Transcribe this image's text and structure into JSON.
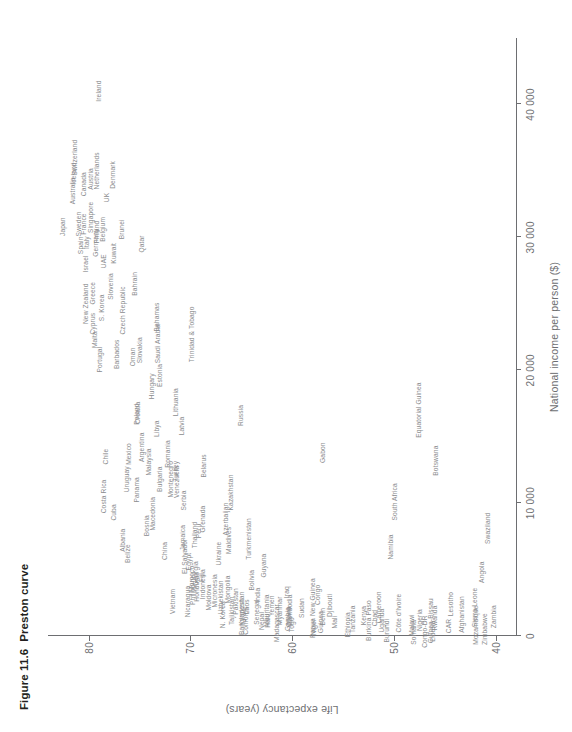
{
  "figure": {
    "number": "Figure 11.6",
    "title": "Preston curve"
  },
  "chart_data": {
    "type": "scatter",
    "title": "Preston curve",
    "xlabel": "National income per person ($)",
    "ylabel": "Life expectancy (years)",
    "xlim": [
      0,
      45000
    ],
    "ylim": [
      38,
      84
    ],
    "xticks": [
      0,
      10000,
      20000,
      30000,
      40000
    ],
    "xtick_labels": [
      "0",
      "10 000",
      "20 000",
      "30 000",
      "40 000"
    ],
    "yticks": [
      40,
      50,
      60,
      70,
      80
    ],
    "ytick_labels": [
      "40",
      "50",
      "60",
      "70",
      "80"
    ],
    "grid": false,
    "legend": null,
    "point_style": "text-label",
    "points": [
      {
        "label": "Zambia",
        "x": 1450,
        "y": 40.2
      },
      {
        "label": "Zimbabwe",
        "x": 520,
        "y": 41.0
      },
      {
        "label": "Mozambique",
        "x": 820,
        "y": 41.9
      },
      {
        "label": "Angola",
        "x": 4800,
        "y": 41.3
      },
      {
        "label": "Sierra Leone",
        "x": 2150,
        "y": 42.0
      },
      {
        "label": "Swaziland",
        "x": 8100,
        "y": 40.8
      },
      {
        "label": "Afghanistan",
        "x": 1620,
        "y": 43.3
      },
      {
        "label": "Lesotho",
        "x": 2400,
        "y": 44.4
      },
      {
        "label": "CAR",
        "x": 750,
        "y": 44.6
      },
      {
        "label": "Liberia",
        "x": 360,
        "y": 46.2
      },
      {
        "label": "Rwanda",
        "x": 1350,
        "y": 46.0
      },
      {
        "label": "Congo-DR",
        "x": 330,
        "y": 46.9
      },
      {
        "label": "Guinea-Bissau",
        "x": 1150,
        "y": 46.4
      },
      {
        "label": "Nigeria",
        "x": 1200,
        "y": 47.4
      },
      {
        "label": "Somalia",
        "x": 280,
        "y": 48.0
      },
      {
        "label": "Malawi",
        "x": 830,
        "y": 48.2
      },
      {
        "label": "Botswana",
        "x": 13200,
        "y": 45.9
      },
      {
        "label": "Equatorial Guinea",
        "x": 17000,
        "y": 47.5
      },
      {
        "label": "South Africa",
        "x": 10100,
        "y": 49.9
      },
      {
        "label": "Namibia",
        "x": 6700,
        "y": 50.3
      },
      {
        "label": "Burundi",
        "x": 400,
        "y": 50.7
      },
      {
        "label": "Côte d'Ivoire",
        "x": 1730,
        "y": 49.5
      },
      {
        "label": "Cameroon",
        "x": 2160,
        "y": 51.5
      },
      {
        "label": "Chad",
        "x": 1350,
        "y": 51.9
      },
      {
        "label": "Uganda",
        "x": 1160,
        "y": 51.2
      },
      {
        "label": "Burkina Faso",
        "x": 1160,
        "y": 52.4
      },
      {
        "label": "Kenya",
        "x": 1540,
        "y": 52.9
      },
      {
        "label": "Tanzania",
        "x": 1260,
        "y": 54.0
      },
      {
        "label": "Ethiopia",
        "x": 850,
        "y": 54.5
      },
      {
        "label": "Mali",
        "x": 1050,
        "y": 55.8
      },
      {
        "label": "Djibouti",
        "x": 2300,
        "y": 56.3
      },
      {
        "label": "Guinea",
        "x": 1050,
        "y": 57.2
      },
      {
        "label": "Niger",
        "x": 680,
        "y": 57.9
      },
      {
        "label": "Gabon",
        "x": 13800,
        "y": 57.0
      },
      {
        "label": "Papua New Guinea",
        "x": 2100,
        "y": 58.0
      },
      {
        "label": "Sudan",
        "x": 2100,
        "y": 59.0
      },
      {
        "label": "Gambia",
        "x": 1280,
        "y": 60.4
      },
      {
        "label": "Togo",
        "x": 850,
        "y": 60.0
      },
      {
        "label": "Ghana",
        "x": 1460,
        "y": 60.3
      },
      {
        "label": "Cambodia",
        "x": 1950,
        "y": 60.2
      },
      {
        "label": "Iraq",
        "x": 3300,
        "y": 60.5
      },
      {
        "label": "Madagascar",
        "x": 980,
        "y": 61.5
      },
      {
        "label": "Haiti",
        "x": 1150,
        "y": 62.4
      },
      {
        "label": "Benin",
        "x": 1450,
        "y": 57.0
      },
      {
        "label": "Congo",
        "x": 3100,
        "y": 57.5
      },
      {
        "label": "Senegal",
        "x": 1790,
        "y": 63.5
      },
      {
        "label": "Comoros",
        "x": 1150,
        "y": 64.5
      },
      {
        "label": "Yemen",
        "x": 2270,
        "y": 62.0
      },
      {
        "label": "Myanmar",
        "x": 1900,
        "y": 61.2
      },
      {
        "label": "Nepal",
        "x": 1130,
        "y": 63.0
      },
      {
        "label": "Laos",
        "x": 2200,
        "y": 64.4
      },
      {
        "label": "Mauritania",
        "x": 1920,
        "y": 62.5
      },
      {
        "label": "Bangladesh",
        "x": 1440,
        "y": 64.9
      },
      {
        "label": "Pakistan",
        "x": 2600,
        "y": 65.5
      },
      {
        "label": "India",
        "x": 3080,
        "y": 63.4
      },
      {
        "label": "Bolivia",
        "x": 4200,
        "y": 63.9
      },
      {
        "label": "Guyana",
        "x": 5300,
        "y": 62.8
      },
      {
        "label": "Kyrgyzstan",
        "x": 2050,
        "y": 64.9
      },
      {
        "label": "Mongolia",
        "x": 3500,
        "y": 66.3
      },
      {
        "label": "N. Korea",
        "x": 1600,
        "y": 66.8
      },
      {
        "label": "Tajikistan",
        "x": 1900,
        "y": 65.9
      },
      {
        "label": "Turkmenistan",
        "x": 7300,
        "y": 64.2
      },
      {
        "label": "Azerbaijan",
        "x": 8800,
        "y": 66.5
      },
      {
        "label": "Uzbekistan",
        "x": 2900,
        "y": 67.0
      },
      {
        "label": "Moldova",
        "x": 2900,
        "y": 68.2
      },
      {
        "label": "Indonesia",
        "x": 3900,
        "y": 68.8
      },
      {
        "label": "Fiji",
        "x": 4400,
        "y": 68.9
      },
      {
        "label": "Belarus",
        "x": 12800,
        "y": 68.7
      },
      {
        "label": "Georgia",
        "x": 4700,
        "y": 69.5
      },
      {
        "label": "Morocco",
        "x": 4300,
        "y": 69.8
      },
      {
        "label": "Nicaragua",
        "x": 2600,
        "y": 70.2
      },
      {
        "label": "Egypt",
        "x": 5600,
        "y": 70.1
      },
      {
        "label": "Honduras",
        "x": 3700,
        "y": 69.4
      },
      {
        "label": "Serbia",
        "x": 10200,
        "y": 70.6
      },
      {
        "label": "Jamaica",
        "x": 7400,
        "y": 70.7
      },
      {
        "label": "Peru",
        "x": 7900,
        "y": 69.2
      },
      {
        "label": "Venezuela",
        "x": 11600,
        "y": 71.3
      },
      {
        "label": "Philippines",
        "x": 3600,
        "y": 69.7
      },
      {
        "label": "El Salvador",
        "x": 6000,
        "y": 70.5
      },
      {
        "label": "Vietnam",
        "x": 2600,
        "y": 71.7
      },
      {
        "label": "Montenegro",
        "x": 11800,
        "y": 71.9
      },
      {
        "label": "Russia",
        "x": 16600,
        "y": 65.0
      },
      {
        "label": "Kazakhstan",
        "x": 10800,
        "y": 66.0
      },
      {
        "label": "Maldives",
        "x": 7200,
        "y": 66.2
      },
      {
        "label": "Ukraine",
        "x": 6200,
        "y": 67.2
      },
      {
        "label": "Micronesia",
        "x": 3400,
        "y": 67.6
      },
      {
        "label": "Grenada",
        "x": 8800,
        "y": 68.8
      },
      {
        "label": "Thailand",
        "x": 7600,
        "y": 69.6
      },
      {
        "label": "Turkey",
        "x": 12400,
        "y": 71.4
      },
      {
        "label": "Romania",
        "x": 13700,
        "y": 72.2
      },
      {
        "label": "Bulgaria",
        "x": 11800,
        "y": 73.0
      },
      {
        "label": "China",
        "x": 6400,
        "y": 72.5
      },
      {
        "label": "Macedonia",
        "x": 9200,
        "y": 73.7
      },
      {
        "label": "Bosnia",
        "x": 8300,
        "y": 74.3
      },
      {
        "label": "Croatia",
        "x": 16800,
        "y": 75.2
      },
      {
        "label": "Panama",
        "x": 11000,
        "y": 75.3
      },
      {
        "label": "Malaysia",
        "x": 13100,
        "y": 74.1
      },
      {
        "label": "Libya",
        "x": 15600,
        "y": 73.3
      },
      {
        "label": "Lithuania",
        "x": 17600,
        "y": 71.4
      },
      {
        "label": "Latvia",
        "x": 15800,
        "y": 70.8
      },
      {
        "label": "Poland",
        "x": 16700,
        "y": 75.3
      },
      {
        "label": "Mexico",
        "x": 13700,
        "y": 76.0
      },
      {
        "label": "Argentina",
        "x": 14200,
        "y": 74.8
      },
      {
        "label": "Uruguay",
        "x": 11800,
        "y": 76.2
      },
      {
        "label": "Cuba",
        "x": 9300,
        "y": 77.5
      },
      {
        "label": "Costa Rica",
        "x": 10500,
        "y": 78.5
      },
      {
        "label": "Chile",
        "x": 13500,
        "y": 78.3
      },
      {
        "label": "Belize",
        "x": 6200,
        "y": 76.1
      },
      {
        "label": "Albania",
        "x": 7200,
        "y": 76.6
      },
      {
        "label": "Estonia",
        "x": 19600,
        "y": 73.0
      },
      {
        "label": "Saudi Arabia",
        "x": 22000,
        "y": 73.2
      },
      {
        "label": "Trinidad & Tobago",
        "x": 22700,
        "y": 69.8
      },
      {
        "label": "Bahamas",
        "x": 24000,
        "y": 73.3
      },
      {
        "label": "Slovakia",
        "x": 21500,
        "y": 75.0
      },
      {
        "label": "Oman",
        "x": 21000,
        "y": 75.6
      },
      {
        "label": "Hungary",
        "x": 18800,
        "y": 73.8
      },
      {
        "label": "Barbados",
        "x": 21200,
        "y": 77.2
      },
      {
        "label": "Portugal",
        "x": 20800,
        "y": 78.9
      },
      {
        "label": "Greece",
        "x": 25800,
        "y": 79.6
      },
      {
        "label": "Malta",
        "x": 22300,
        "y": 79.4
      },
      {
        "label": "Bahrain",
        "x": 26500,
        "y": 75.4
      },
      {
        "label": "Czech Republic",
        "x": 24500,
        "y": 76.6
      },
      {
        "label": "Slovenia",
        "x": 26300,
        "y": 77.8
      },
      {
        "label": "S. Korea",
        "x": 24700,
        "y": 78.7
      },
      {
        "label": "Cyprus",
        "x": 23500,
        "y": 79.6
      },
      {
        "label": "New Zealand",
        "x": 25000,
        "y": 80.3
      },
      {
        "label": "Qatar",
        "x": 29500,
        "y": 74.8
      },
      {
        "label": "Brunei",
        "x": 30600,
        "y": 76.7
      },
      {
        "label": "Kuwait",
        "x": 28800,
        "y": 77.5
      },
      {
        "label": "UAE",
        "x": 28200,
        "y": 78.5
      },
      {
        "label": "Germany",
        "x": 29600,
        "y": 79.3
      },
      {
        "label": "Israel",
        "x": 28000,
        "y": 80.3
      },
      {
        "label": "Belgium",
        "x": 30600,
        "y": 78.6
      },
      {
        "label": "Finland",
        "x": 30400,
        "y": 79.2
      },
      {
        "label": "Singapore",
        "x": 31500,
        "y": 79.8
      },
      {
        "label": "Italy",
        "x": 29600,
        "y": 80.2
      },
      {
        "label": "France",
        "x": 31000,
        "y": 80.5
      },
      {
        "label": "Spain",
        "x": 29400,
        "y": 80.8
      },
      {
        "label": "Sweden",
        "x": 31000,
        "y": 81.0
      },
      {
        "label": "Japan",
        "x": 30800,
        "y": 82.5
      },
      {
        "label": "Australia",
        "x": 33500,
        "y": 81.5
      },
      {
        "label": "UK",
        "x": 33000,
        "y": 78.2
      },
      {
        "label": "Denmark",
        "x": 34700,
        "y": 77.6
      },
      {
        "label": "Netherlands",
        "x": 35000,
        "y": 79.2
      },
      {
        "label": "Austria",
        "x": 34400,
        "y": 79.8
      },
      {
        "label": "Canada",
        "x": 34000,
        "y": 80.5
      },
      {
        "label": "Switzerland",
        "x": 36000,
        "y": 81.3
      },
      {
        "label": "Iceland",
        "x": 34800,
        "y": 81.4
      },
      {
        "label": "Ireland",
        "x": 41000,
        "y": 79.0
      }
    ]
  }
}
